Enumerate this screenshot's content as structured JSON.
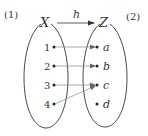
{
  "diagram": {
    "type": "mapping",
    "part_labels": {
      "left": "(1)",
      "right": "(2)"
    },
    "domain_set": {
      "name": "X",
      "elements": [
        "1",
        "2",
        "3",
        "4"
      ]
    },
    "codomain_set": {
      "name": "Z",
      "elements": [
        "a",
        "b",
        "c",
        "d"
      ]
    },
    "function": {
      "name": "h",
      "mappings": [
        {
          "from": "1",
          "to": "a"
        },
        {
          "from": "2",
          "to": "b"
        },
        {
          "from": "3",
          "to": "c"
        },
        {
          "from": "4",
          "to": "c"
        }
      ]
    },
    "colors": {
      "stroke": "#333333",
      "arrow": "#888888",
      "background": "#ffffff"
    }
  }
}
